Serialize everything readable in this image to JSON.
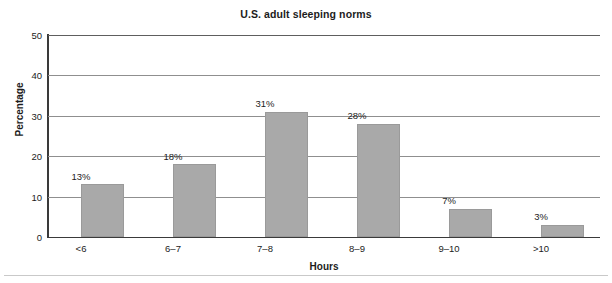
{
  "chart_data": {
    "type": "bar",
    "title": "U.S. adult sleeping norms",
    "xlabel": "Hours",
    "ylabel": "Percentage",
    "categories": [
      "<6",
      "6–7",
      "7–8",
      "8–9",
      "9–10",
      ">10"
    ],
    "values": [
      13,
      18,
      31,
      28,
      7,
      3
    ],
    "data_labels": [
      "13%",
      "18%",
      "31%",
      "28%",
      "7%",
      "3%"
    ],
    "ylim": [
      0,
      50
    ],
    "yticks": [
      0,
      10,
      20,
      30,
      40,
      50
    ],
    "ytick_labels": [
      "0",
      "10",
      "20",
      "30",
      "40",
      "50"
    ],
    "grid": "horizontal",
    "legend": "none",
    "bar_color": "#a9a9a9",
    "gridline_color": "#8f8f8f",
    "axis_color": "#3a3a3a",
    "text_color": "#1c1c1c"
  }
}
